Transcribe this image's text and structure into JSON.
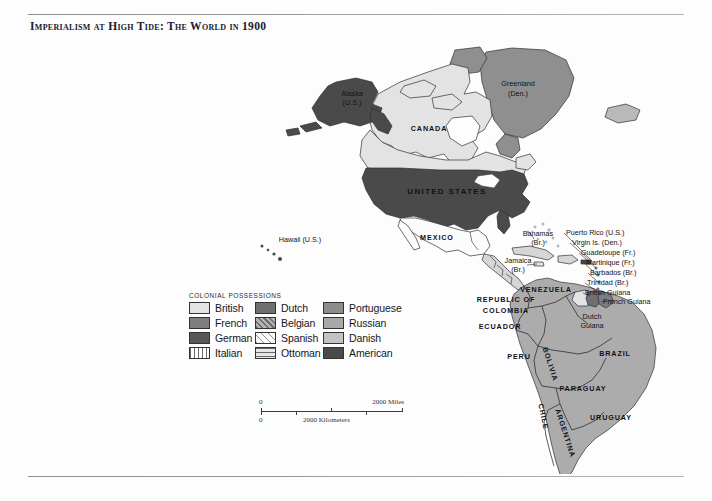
{
  "document": {
    "title": "Imperialism at High Tide: The World in 1900"
  },
  "legend": {
    "heading": "Colonial Possessions",
    "entries": [
      {
        "label": "British",
        "color": "#e3e3e3",
        "pattern": "solid"
      },
      {
        "label": "Dutch",
        "color": "#6f6f6f",
        "pattern": "solid"
      },
      {
        "label": "Portuguese",
        "color": "#8d8d8d",
        "pattern": "solid"
      },
      {
        "label": "French",
        "color": "#7e7e7e",
        "pattern": "solid"
      },
      {
        "label": "Belgian",
        "color": "#9a9a9a",
        "pattern": "diagonal"
      },
      {
        "label": "Russian",
        "color": "#a8a8a8",
        "pattern": "solid"
      },
      {
        "label": "German",
        "color": "#585858",
        "pattern": "solid"
      },
      {
        "label": "Spanish",
        "color": "#f4f4f4",
        "pattern": "diagonal-light"
      },
      {
        "label": "Danish",
        "color": "#c2c2c2",
        "pattern": "solid"
      },
      {
        "label": "Italian",
        "color": "#ffffff",
        "pattern": "vertical"
      },
      {
        "label": "Ottoman",
        "color": "#dcdcdc",
        "pattern": "horizontal"
      },
      {
        "label": "American",
        "color": "#4a4a4a",
        "pattern": "solid"
      }
    ]
  },
  "scalebar": {
    "miles_start": "0",
    "miles_end": "2000 Miles",
    "km_start": "0",
    "km_end": "2000 Kilometers"
  },
  "map": {
    "labels": [
      {
        "name": "alaska",
        "text": "Alaska",
        "x": 352,
        "y": 62,
        "anchor": "middle",
        "style": "isl",
        "fill": "#ffffff"
      },
      {
        "name": "alaska-us",
        "text": "(U.S.)",
        "x": 352,
        "y": 71,
        "anchor": "middle",
        "style": "isl",
        "fill": "#ffffff"
      },
      {
        "name": "canada",
        "text": "CANADA",
        "x": 429,
        "y": 97,
        "anchor": "middle",
        "style": "country"
      },
      {
        "name": "greenland",
        "text": "Greenland",
        "x": 518,
        "y": 52,
        "anchor": "middle",
        "style": "isl"
      },
      {
        "name": "greenland-den",
        "text": "(Den.)",
        "x": 518,
        "y": 62,
        "anchor": "middle",
        "style": "isl"
      },
      {
        "name": "united-states",
        "text": "UNITED STATES",
        "x": 447,
        "y": 160,
        "anchor": "middle",
        "style": "big",
        "fill": "#ffffff"
      },
      {
        "name": "mexico",
        "text": "MEXICO",
        "x": 437,
        "y": 206,
        "anchor": "middle",
        "style": "country"
      },
      {
        "name": "hawaii",
        "text": "Hawaii (U.S.)",
        "x": 300,
        "y": 208,
        "anchor": "middle",
        "style": "isl"
      },
      {
        "name": "bahamas",
        "text": "Bahamas",
        "x": 538,
        "y": 202,
        "anchor": "middle",
        "style": "isl"
      },
      {
        "name": "bahamas-br",
        "text": "(Br.)",
        "x": 538,
        "y": 211,
        "anchor": "middle",
        "style": "isl"
      },
      {
        "name": "jamaica",
        "text": "Jamaica",
        "x": 518,
        "y": 229,
        "anchor": "middle",
        "style": "isl"
      },
      {
        "name": "jamaica-br",
        "text": "(Br.)",
        "x": 518,
        "y": 238,
        "anchor": "middle",
        "style": "isl"
      },
      {
        "name": "puerto-rico",
        "text": "Puerto Rico (U.S.)",
        "x": 566,
        "y": 201,
        "anchor": "start",
        "style": "isl"
      },
      {
        "name": "virgin-islands",
        "text": "Virgin Is. (Den.)",
        "x": 572,
        "y": 211,
        "anchor": "start",
        "style": "isl"
      },
      {
        "name": "guadeloupe",
        "text": "Guadeloupe (Fr.)",
        "x": 581,
        "y": 221,
        "anchor": "start",
        "style": "isl"
      },
      {
        "name": "martinique",
        "text": "Martinique (Fr.)",
        "x": 586,
        "y": 231,
        "anchor": "start",
        "style": "isl"
      },
      {
        "name": "barbados",
        "text": "Barbados (Br.)",
        "x": 590,
        "y": 241,
        "anchor": "start",
        "style": "isl"
      },
      {
        "name": "trinidad",
        "text": "Trinidad (Br.)",
        "x": 587,
        "y": 251,
        "anchor": "start",
        "style": "isl"
      },
      {
        "name": "british-guiana",
        "text": "British Guiana",
        "x": 585,
        "y": 261,
        "anchor": "start",
        "style": "isl"
      },
      {
        "name": "french-guiana",
        "text": "French Guiana",
        "x": 603,
        "y": 270,
        "anchor": "start",
        "style": "isl"
      },
      {
        "name": "dutch-guiana",
        "text": "Dutch",
        "x": 592,
        "y": 285,
        "anchor": "middle",
        "style": "isl"
      },
      {
        "name": "dutch-guiana-2",
        "text": "Guiana",
        "x": 592,
        "y": 294,
        "anchor": "middle",
        "style": "isl"
      },
      {
        "name": "venezuela",
        "text": "VENEZUELA",
        "x": 546,
        "y": 258,
        "anchor": "middle",
        "style": "country"
      },
      {
        "name": "colombia-1",
        "text": "REPUBLIC OF",
        "x": 506,
        "y": 268,
        "anchor": "middle",
        "style": "country"
      },
      {
        "name": "colombia-2",
        "text": "COLOMBIA",
        "x": 506,
        "y": 279,
        "anchor": "middle",
        "style": "country"
      },
      {
        "name": "ecuador",
        "text": "ECUADOR",
        "x": 500,
        "y": 295,
        "anchor": "middle",
        "style": "country"
      },
      {
        "name": "peru",
        "text": "PERU",
        "x": 519,
        "y": 325,
        "anchor": "middle",
        "style": "country"
      },
      {
        "name": "brazil",
        "text": "BRAZIL",
        "x": 615,
        "y": 322,
        "anchor": "middle",
        "style": "country"
      },
      {
        "name": "bolivia",
        "text": "BOLIVIA",
        "x": 548,
        "y": 331,
        "anchor": "middle",
        "style": "country",
        "rotate": 72
      },
      {
        "name": "paraguay",
        "text": "PARAGUAY",
        "x": 583,
        "y": 357,
        "anchor": "middle",
        "style": "country"
      },
      {
        "name": "chile",
        "text": "CHILE",
        "x": 541,
        "y": 383,
        "anchor": "middle",
        "style": "country",
        "rotate": 78
      },
      {
        "name": "argentina",
        "text": "ARGENTINA",
        "x": 563,
        "y": 400,
        "anchor": "middle",
        "style": "country",
        "rotate": 72
      },
      {
        "name": "uruguay",
        "text": "URUGUAY",
        "x": 611,
        "y": 386,
        "anchor": "middle",
        "style": "country"
      }
    ]
  }
}
